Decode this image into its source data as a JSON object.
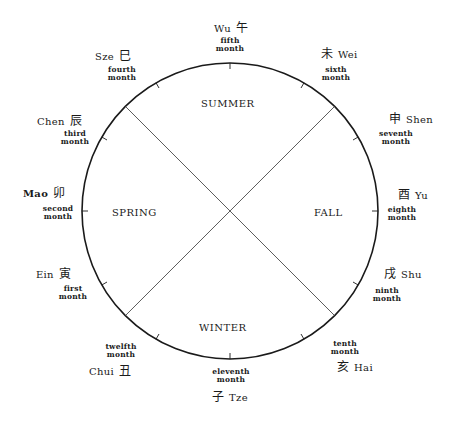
{
  "diagram": {
    "circle": {
      "cx": 230,
      "cy": 211,
      "r": 148,
      "stroke": "#1a1a1a"
    },
    "seasons": [
      {
        "label": "Summer",
        "x": 229,
        "y": 104
      },
      {
        "label": "Spring",
        "x": 138,
        "y": 213
      },
      {
        "label": "Fall",
        "x": 330,
        "y": 213
      },
      {
        "label": "Winter",
        "x": 230,
        "y": 328
      }
    ],
    "months": [
      {
        "name": "Wu",
        "char": "午",
        "ordinal": "fifth",
        "unit": "month"
      },
      {
        "name": "Wei",
        "char": "未",
        "ordinal": "sixth",
        "unit": "month"
      },
      {
        "name": "Shen",
        "char": "申",
        "ordinal": "seventh",
        "unit": "month"
      },
      {
        "name": "Yu",
        "char": "酉",
        "ordinal": "eighth",
        "unit": "month"
      },
      {
        "name": "Shu",
        "char": "戌",
        "ordinal": "ninth",
        "unit": "month"
      },
      {
        "name": "Hai",
        "char": "亥",
        "ordinal": "tenth",
        "unit": "month"
      },
      {
        "name": "Tze",
        "char": "子",
        "ordinal": "eleventh",
        "unit": "month"
      },
      {
        "name": "Chui",
        "char": "丑",
        "ordinal": "twelfth",
        "unit": "month"
      },
      {
        "name": "Ein",
        "char": "寅",
        "ordinal": "first",
        "unit": "month"
      },
      {
        "name": "Mao",
        "char": "卯",
        "ordinal": "second",
        "unit": "month"
      },
      {
        "name": "Chen",
        "char": "辰",
        "ordinal": "third",
        "unit": "month"
      },
      {
        "name": "Sze",
        "char": "巳",
        "ordinal": "fourth",
        "unit": "month"
      }
    ]
  }
}
